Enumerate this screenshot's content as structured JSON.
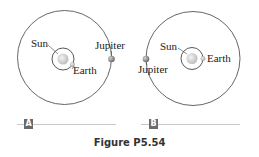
{
  "panels": [
    {
      "id": "A",
      "badge": "A",
      "labels": {
        "sun": "Sun",
        "earth": "Earth",
        "jupiter": "Jupiter"
      },
      "jupiter_position": "right",
      "earth_position": "lower-right"
    },
    {
      "id": "B",
      "badge": "B",
      "labels": {
        "sun": "Sun",
        "earth": "Earth",
        "jupiter": "Jupiter"
      },
      "jupiter_position": "left",
      "earth_position": "right"
    }
  ],
  "caption": "Figure P5.54",
  "colors": {
    "orbit": "#555555",
    "planet": "#9a9a9a",
    "sun": "#d8d8d8",
    "badge": "#6a6a6a"
  }
}
